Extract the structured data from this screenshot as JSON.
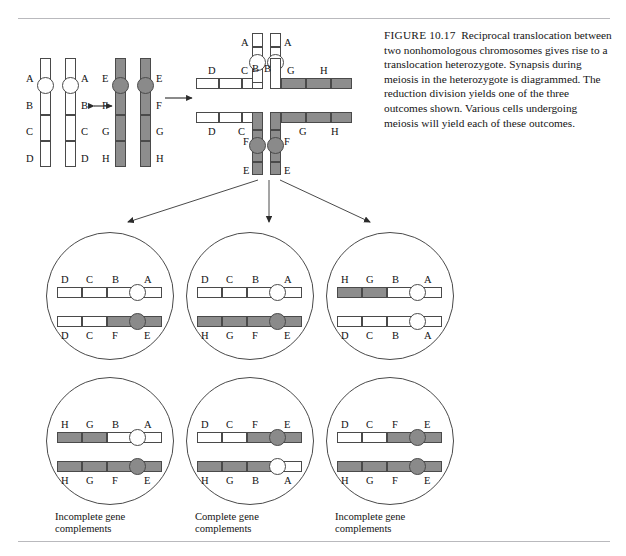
{
  "figure": {
    "label": "FIGURE",
    "number": "10.17",
    "caption": "Reciprocal translocation between two nonhomologous chromosomes gives rise to a translocation heterozygote. Synapsis during meiosis in the heterozygote is diagrammed. The reduction division yields one of the three outcomes shown. Various cells undergoing meiosis will yield each of these outcomes."
  },
  "colors": {
    "white_chromosome": "#ffffff",
    "gray_chromosome": "#8d8d8d",
    "dark_band": "#5f5f5f",
    "outline": "#4a4a4a",
    "rule": "#b9b9bd",
    "text": "#151515"
  },
  "parental": {
    "pair_white": {
      "fill": "white",
      "labels_left": [
        "A",
        "B",
        "C",
        "D"
      ],
      "labels_right": [
        "A",
        "B",
        "C",
        "D"
      ]
    },
    "pair_gray": {
      "fill": "gray",
      "labels_left": [
        "E",
        "F",
        "G",
        "H"
      ],
      "labels_right": [
        "E",
        "F",
        "G",
        "H"
      ]
    },
    "exchange_arrow": "double-headed-arrow",
    "to_synapsis_arrow": "right-arrow"
  },
  "synapsis": {
    "description": "cross-shaped synapsis configuration of translocation heterozygote",
    "arms": [
      {
        "name": "upper-right-normal-white",
        "labels": [
          "A",
          "B"
        ],
        "fill": "white"
      },
      {
        "name": "upper-left-normal-white",
        "labels": [
          "D",
          "C"
        ],
        "fill": "white"
      },
      {
        "name": "upper-right-translocated",
        "labels": [
          "G",
          "H"
        ],
        "fill": "gray"
      },
      {
        "name": "lower-left-translocated-white",
        "labels": [
          "D",
          "C"
        ],
        "fill": "white"
      },
      {
        "name": "lower-left-gray",
        "labels": [
          "F",
          "E"
        ],
        "fill": "gray"
      },
      {
        "name": "lower-right-gray",
        "labels": [
          "F",
          "E"
        ],
        "fill": "gray"
      },
      {
        "name": "lower-right-arm",
        "labels": [
          "G",
          "H"
        ],
        "fill": "gray"
      }
    ]
  },
  "outcomes": [
    {
      "id": "left-column",
      "caption_line1": "Incomplete gene",
      "caption_line2": "complements",
      "cells": [
        {
          "position": "top",
          "chromosomes": [
            {
              "labels_above": [
                "D",
                "C",
                "B",
                "A"
              ],
              "labels_below": [],
              "fills": [
                "white",
                "white",
                "white",
                "white"
              ],
              "centromere": "white"
            },
            {
              "labels_above": [],
              "labels_below": [
                "D",
                "C",
                "F",
                "E"
              ],
              "fills": [
                "white",
                "white",
                "gray",
                "gray"
              ],
              "centromere": "gray"
            }
          ]
        },
        {
          "position": "bottom",
          "chromosomes": [
            {
              "labels_above": [
                "H",
                "G",
                "B",
                "A"
              ],
              "labels_below": [],
              "fills": [
                "gray",
                "gray",
                "white",
                "white"
              ],
              "centromere": "white"
            },
            {
              "labels_above": [],
              "labels_below": [
                "H",
                "G",
                "F",
                "E"
              ],
              "fills": [
                "gray",
                "gray",
                "gray",
                "gray"
              ],
              "centromere": "gray"
            }
          ]
        }
      ]
    },
    {
      "id": "middle-column",
      "caption_line1": "Complete gene",
      "caption_line2": "complements",
      "cells": [
        {
          "position": "top",
          "chromosomes": [
            {
              "labels_above": [
                "D",
                "C",
                "B",
                "A"
              ],
              "labels_below": [],
              "fills": [
                "white",
                "white",
                "white",
                "white"
              ],
              "centromere": "white"
            },
            {
              "labels_above": [],
              "labels_below": [
                "H",
                "G",
                "F",
                "E"
              ],
              "fills": [
                "gray",
                "gray",
                "gray",
                "gray"
              ],
              "centromere": "gray"
            }
          ]
        },
        {
          "position": "bottom",
          "chromosomes": [
            {
              "labels_above": [
                "D",
                "C",
                "F",
                "E"
              ],
              "labels_below": [],
              "fills": [
                "white",
                "white",
                "gray",
                "gray"
              ],
              "centromere": "gray"
            },
            {
              "labels_above": [],
              "labels_below": [
                "H",
                "G",
                "B",
                "A"
              ],
              "fills": [
                "gray",
                "gray",
                "white",
                "white"
              ],
              "centromere": "white"
            }
          ]
        }
      ]
    },
    {
      "id": "right-column",
      "caption_line1": "Incomplete gene",
      "caption_line2": "complements",
      "cells": [
        {
          "position": "top",
          "chromosomes": [
            {
              "labels_above": [
                "H",
                "G",
                "B",
                "A"
              ],
              "labels_below": [],
              "fills": [
                "gray",
                "gray",
                "white",
                "white"
              ],
              "centromere": "white"
            },
            {
              "labels_above": [],
              "labels_below": [
                "D",
                "C",
                "B",
                "A"
              ],
              "fills": [
                "white",
                "white",
                "white",
                "white"
              ],
              "centromere": "white"
            }
          ]
        },
        {
          "position": "bottom",
          "chromosomes": [
            {
              "labels_above": [
                "D",
                "C",
                "F",
                "E"
              ],
              "labels_below": [],
              "fills": [
                "white",
                "white",
                "gray",
                "gray"
              ],
              "centromere": "gray"
            },
            {
              "labels_above": [],
              "labels_below": [
                "H",
                "G",
                "F",
                "E"
              ],
              "fills": [
                "gray",
                "gray",
                "gray",
                "gray"
              ],
              "centromere": "gray"
            }
          ]
        }
      ]
    }
  ]
}
